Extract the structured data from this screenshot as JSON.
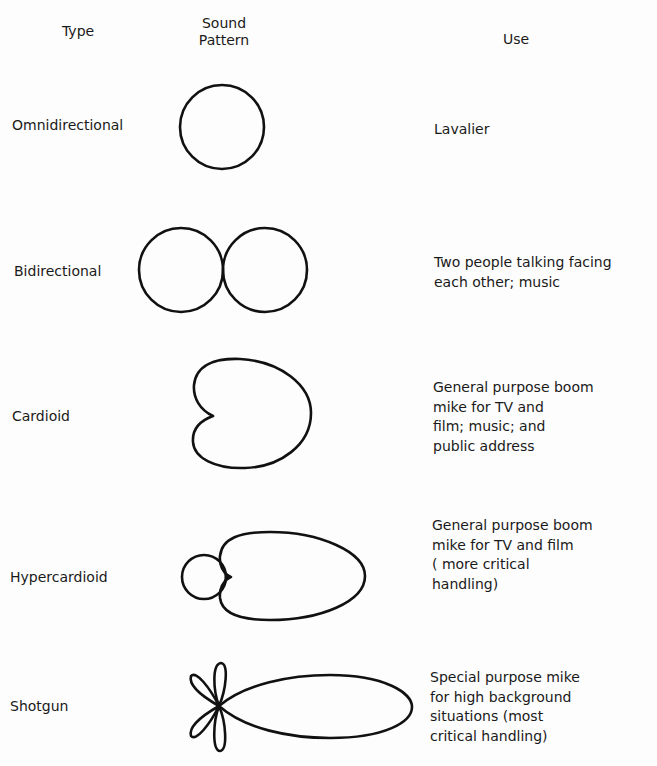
{
  "headers": {
    "type": "Type",
    "pattern_line1": "Sound",
    "pattern_line2": "Pattern",
    "use": "Use"
  },
  "rows": [
    {
      "type": "Omnidirectional",
      "pattern": "circle",
      "use": "Lavalier"
    },
    {
      "type": "Bidirectional",
      "pattern": "figure-eight",
      "use": "Two people talking facing\neach other; music"
    },
    {
      "type": "Cardioid",
      "pattern": "heart-shaped",
      "use": "General purpose boom\nmike for TV and\nfilm; music; and\npublic address"
    },
    {
      "type": "Hypercardioid",
      "pattern": "narrow front lobe with small rear lobe",
      "use": "General purpose boom\nmike for TV and film\n( more critical\nhandling)"
    },
    {
      "type": "Shotgun",
      "pattern": "long narrow front lobe with small side/rear lobes",
      "use": "Special purpose mike\nfor high background\nsituations (most\ncritical handling)"
    }
  ],
  "colors": {
    "ink": "#111111",
    "background": "#fdfdfd"
  }
}
